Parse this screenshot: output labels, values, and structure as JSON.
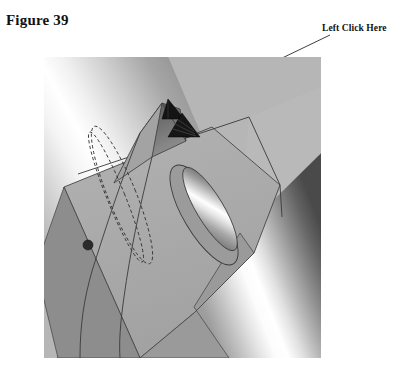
{
  "figure": {
    "caption": "Figure 39"
  },
  "callout": {
    "label": "Left Click Here",
    "leader_from": {
      "x": 330,
      "y": 35
    },
    "leader_to": {
      "x": 172,
      "y": 111
    }
  },
  "viewport": {
    "name": "cad-model-viewport",
    "left": 44,
    "top": 57,
    "width": 277,
    "height": 301,
    "background_color": "#b6b6b6"
  },
  "colors": {
    "page_background": "#ffffff",
    "text": "#111111",
    "model_face_light": "#c9c9c9",
    "model_face_mid": "#b0b0b0",
    "model_face_dark": "#8f8f8f",
    "model_face_shadow": "#6d6d6d",
    "cylinder_highlight": "#ffffff",
    "cylinder_shadow": "#4a4a4a",
    "edge_line": "#3a3a3a",
    "construction_line": "#2e2e2e",
    "marker_fill": "#1a1a1a",
    "leader_line": "#2a2a2a"
  },
  "model": {
    "name": "shaft-with-yoke-bracket",
    "features": [
      {
        "name": "upper-left-cylindrical-shaft",
        "kind": "cylinder",
        "shading": "specular-highlight"
      },
      {
        "name": "lower-right-cylindrical-shaft",
        "kind": "cylinder",
        "shading": "specular-highlight"
      },
      {
        "name": "yoke-bracket-plate",
        "kind": "planar-face"
      },
      {
        "name": "elliptical-slot",
        "kind": "through-slot"
      },
      {
        "name": "dashed-construction-ellipse",
        "kind": "construction-curve"
      },
      {
        "name": "selected-vertex-dot",
        "kind": "vertex-marker"
      }
    ],
    "markers": [
      {
        "name": "selection-arrow-marker-primary",
        "x": 129,
        "y": 54
      },
      {
        "name": "selection-arrow-marker-secondary",
        "x": 140,
        "y": 68
      },
      {
        "name": "vertex-point-marker",
        "x": 44,
        "y": 188
      }
    ]
  }
}
